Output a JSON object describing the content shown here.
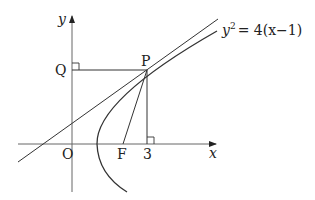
{
  "figure": {
    "title": "",
    "labels": {
      "y_axis": "y",
      "x_axis": "x",
      "origin": "O",
      "point_q": "Q",
      "point_p": "P",
      "focus": "F",
      "x_tick": "3"
    },
    "equation": {
      "lhs_var": "y",
      "lhs_exp": "2",
      "rhs": "= 4(x−1)"
    },
    "colors": {
      "stroke": "#333333",
      "axis": "#555555",
      "text": "#222222"
    }
  }
}
